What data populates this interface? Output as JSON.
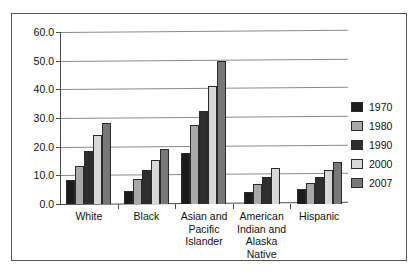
{
  "chart_data": {
    "type": "bar",
    "title": "",
    "subtitle": "",
    "xlabel": "",
    "ylabel": "",
    "ylim": [
      0,
      60
    ],
    "ytick_step": 10,
    "ytick_labels": [
      "0.0",
      "10.0",
      "20.0",
      "30.0",
      "40.0",
      "50.0",
      "60.0"
    ],
    "grid": true,
    "grid_axis": "y",
    "legend_position": "right",
    "categories": [
      "White",
      "Black",
      "Asian and Pacific Islander",
      "American Indian and Alaska Native",
      "Hispanic"
    ],
    "category_label_lines": [
      [
        "White"
      ],
      [
        "Black"
      ],
      [
        "Asian and",
        "Pacific",
        "Islander"
      ],
      [
        "American",
        "Indian and",
        "Alaska",
        "Native"
      ],
      [
        "Hispanic"
      ]
    ],
    "series": [
      {
        "name": "1970",
        "color": "#1c1c1c",
        "values": [
          8.3,
          4.7,
          17.8,
          4.1,
          5.2
        ]
      },
      {
        "name": "1980",
        "color": "#a8a8a8",
        "values": [
          13.2,
          8.6,
          27.6,
          7.1,
          7.2
        ]
      },
      {
        "name": "1990",
        "color": "#2e2e2e",
        "values": [
          18.4,
          11.9,
          32.3,
          9.4,
          9.4
        ]
      },
      {
        "name": "2000",
        "color": "#d7d7d7",
        "values": [
          24.0,
          15.3,
          41.0,
          12.5,
          12.0
        ]
      },
      {
        "name": "2007",
        "color": "#787878",
        "values": [
          28.4,
          19.3,
          49.8,
          null,
          14.8
        ]
      }
    ]
  },
  "legend": {
    "items": [
      {
        "label": "1970",
        "color": "#1c1c1c"
      },
      {
        "label": "1980",
        "color": "#a8a8a8"
      },
      {
        "label": "1990",
        "color": "#2e2e2e"
      },
      {
        "label": "2000",
        "color": "#d7d7d7"
      },
      {
        "label": "2007",
        "color": "#787878"
      }
    ]
  },
  "colors": {
    "frame_border": "#555555",
    "grid": "#8a8a8a",
    "axis": "#4a4a4a",
    "bar_outline": "#2a2a2a",
    "text": "#111111",
    "background": "#ffffff"
  }
}
